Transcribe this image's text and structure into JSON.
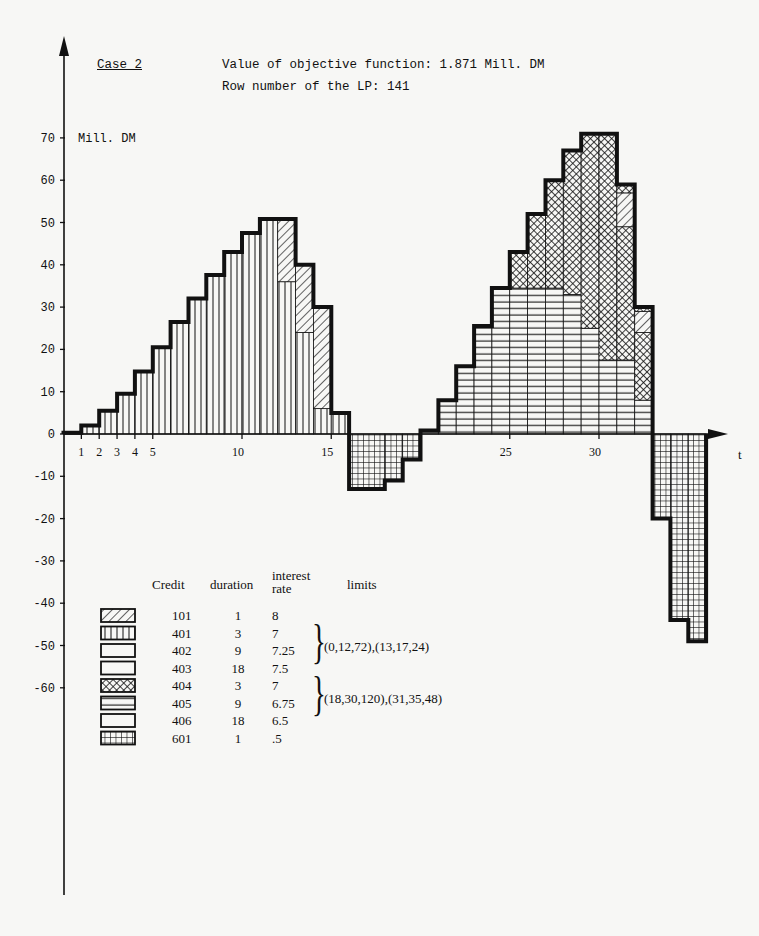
{
  "header": {
    "case_label": "Case 2",
    "objective_text": "Value of objective function: 1.871 Mill. DM",
    "row_number_text": "Row number of the LP:  141"
  },
  "legend": {
    "headers": {
      "credit": "Credit",
      "duration": "duration",
      "interest_line1": "interest",
      "interest_line2": "rate",
      "limits": "limits"
    },
    "rows": [
      {
        "pattern": "diag",
        "credit": "101",
        "duration": "1",
        "rate": "8"
      },
      {
        "pattern": "vert",
        "credit": "401",
        "duration": "3",
        "rate": "7"
      },
      {
        "pattern": "blank",
        "credit": "402",
        "duration": "9",
        "rate": "7.25"
      },
      {
        "pattern": "blank",
        "credit": "403",
        "duration": "18",
        "rate": "7.5"
      },
      {
        "pattern": "cross",
        "credit": "404",
        "duration": "3",
        "rate": "7"
      },
      {
        "pattern": "horiz",
        "credit": "405",
        "duration": "9",
        "rate": "6.75"
      },
      {
        "pattern": "blank",
        "credit": "406",
        "duration": "18",
        "rate": "6.5"
      },
      {
        "pattern": "grid",
        "credit": "601",
        "duration": "1",
        "rate": ".5"
      }
    ],
    "limits_group1": "(0,12,72),(13,17,24)",
    "limits_group2": "(18,30,120),(31,35,48)"
  },
  "chart_data": {
    "type": "bar",
    "xlabel": "t",
    "ylabel": "Mill. DM",
    "ylim": [
      -60,
      70
    ],
    "xlim": [
      0,
      37
    ],
    "yticks": [
      70,
      60,
      50,
      40,
      30,
      20,
      10,
      0,
      -10,
      -20,
      -30,
      -40,
      -50,
      -60
    ],
    "xtick_labels": [
      1,
      2,
      3,
      4,
      5,
      10,
      15,
      25,
      30
    ],
    "grid": false,
    "legend_position": "bottom-left",
    "segments": [
      {
        "t": [
          0,
          1
        ],
        "credit": "401",
        "from": 0,
        "to": 0.3
      },
      {
        "t": [
          1,
          2
        ],
        "credit": "401",
        "from": 0,
        "to": 2
      },
      {
        "t": [
          2,
          3
        ],
        "credit": "401",
        "from": 0,
        "to": 5.5
      },
      {
        "t": [
          3,
          4
        ],
        "credit": "401",
        "from": 0,
        "to": 9.5
      },
      {
        "t": [
          4,
          5
        ],
        "credit": "401",
        "from": 0,
        "to": 14.8
      },
      {
        "t": [
          5,
          6
        ],
        "credit": "401",
        "from": 0,
        "to": 20.5
      },
      {
        "t": [
          6,
          7
        ],
        "credit": "401",
        "from": 0,
        "to": 26.5
      },
      {
        "t": [
          7,
          8
        ],
        "credit": "401",
        "from": 0,
        "to": 32
      },
      {
        "t": [
          8,
          9
        ],
        "credit": "401",
        "from": 0,
        "to": 37.6
      },
      {
        "t": [
          9,
          10
        ],
        "credit": "401",
        "from": 0,
        "to": 43
      },
      {
        "t": [
          10,
          11
        ],
        "credit": "401",
        "from": 0,
        "to": 47.5
      },
      {
        "t": [
          11,
          12
        ],
        "credit": "401",
        "from": 0,
        "to": 50.8
      },
      {
        "t": [
          12,
          13
        ],
        "credit": "401",
        "from": 0,
        "to": 36
      },
      {
        "t": [
          12,
          13
        ],
        "credit": "101",
        "from": 36,
        "to": 50.8
      },
      {
        "t": [
          13,
          14
        ],
        "credit": "401",
        "from": 0,
        "to": 24
      },
      {
        "t": [
          13,
          14
        ],
        "credit": "101",
        "from": 24,
        "to": 40
      },
      {
        "t": [
          14,
          15
        ],
        "credit": "401",
        "from": 0,
        "to": 6
      },
      {
        "t": [
          14,
          15
        ],
        "credit": "101",
        "from": 6,
        "to": 30
      },
      {
        "t": [
          15,
          16
        ],
        "credit": "401",
        "from": 0,
        "to": 5
      },
      {
        "t": [
          16,
          18
        ],
        "credit": "601",
        "from": -13,
        "to": 0
      },
      {
        "t": [
          18,
          19
        ],
        "credit": "601",
        "from": -11,
        "to": 0
      },
      {
        "t": [
          19,
          20
        ],
        "credit": "601",
        "from": -6,
        "to": 0
      },
      {
        "t": [
          20,
          21
        ],
        "credit": "405",
        "from": 0,
        "to": 0.8
      },
      {
        "t": [
          21,
          22
        ],
        "credit": "405",
        "from": 0,
        "to": 8
      },
      {
        "t": [
          22,
          23
        ],
        "credit": "405",
        "from": 0,
        "to": 16
      },
      {
        "t": [
          23,
          24
        ],
        "credit": "405",
        "from": 0,
        "to": 25.5
      },
      {
        "t": [
          24,
          25
        ],
        "credit": "405",
        "from": 0,
        "to": 34.5
      },
      {
        "t": [
          25,
          26
        ],
        "credit": "405",
        "from": 0,
        "to": 34.5
      },
      {
        "t": [
          25,
          26
        ],
        "credit": "404",
        "from": 34.5,
        "to": 43
      },
      {
        "t": [
          26,
          27
        ],
        "credit": "405",
        "from": 0,
        "to": 34.5
      },
      {
        "t": [
          26,
          27
        ],
        "credit": "404",
        "from": 34.5,
        "to": 52
      },
      {
        "t": [
          27,
          28
        ],
        "credit": "405",
        "from": 0,
        "to": 34.5
      },
      {
        "t": [
          27,
          28
        ],
        "credit": "404",
        "from": 34.5,
        "to": 60
      },
      {
        "t": [
          28,
          29
        ],
        "credit": "405",
        "from": 0,
        "to": 33
      },
      {
        "t": [
          28,
          29
        ],
        "credit": "404",
        "from": 33,
        "to": 67
      },
      {
        "t": [
          29,
          30
        ],
        "credit": "405",
        "from": 0,
        "to": 25
      },
      {
        "t": [
          29,
          30
        ],
        "credit": "404",
        "from": 25,
        "to": 71
      },
      {
        "t": [
          30,
          31
        ],
        "credit": "405",
        "from": 0,
        "to": 17.5
      },
      {
        "t": [
          30,
          31
        ],
        "credit": "404",
        "from": 17.5,
        "to": 71
      },
      {
        "t": [
          31,
          32
        ],
        "credit": "405",
        "from": 0,
        "to": 17.5
      },
      {
        "t": [
          31,
          32
        ],
        "credit": "404",
        "from": 17.5,
        "to": 49
      },
      {
        "t": [
          31,
          32
        ],
        "credit": "101",
        "from": 49,
        "to": 57
      },
      {
        "t": [
          31,
          32
        ],
        "credit": "404",
        "from": 57,
        "to": 59
      },
      {
        "t": [
          32,
          33
        ],
        "credit": "405",
        "from": 0,
        "to": 8
      },
      {
        "t": [
          32,
          33
        ],
        "credit": "404",
        "from": 8,
        "to": 24
      },
      {
        "t": [
          32,
          33
        ],
        "credit": "101",
        "from": 24,
        "to": 29
      },
      {
        "t": [
          32,
          33
        ],
        "credit": "404",
        "from": 29,
        "to": 30
      },
      {
        "t": [
          33,
          34
        ],
        "credit": "601",
        "from": -20,
        "to": 0
      },
      {
        "t": [
          34,
          35
        ],
        "credit": "601",
        "from": -44,
        "to": 0
      },
      {
        "t": [
          35,
          36
        ],
        "credit": "601",
        "from": -49,
        "to": 0
      }
    ],
    "outline": [
      [
        0,
        0
      ],
      [
        0,
        0.3
      ],
      [
        1,
        0.3
      ],
      [
        1,
        2
      ],
      [
        2,
        2
      ],
      [
        2,
        5.5
      ],
      [
        3,
        5.5
      ],
      [
        3,
        9.5
      ],
      [
        4,
        9.5
      ],
      [
        4,
        14.8
      ],
      [
        5,
        14.8
      ],
      [
        5,
        20.5
      ],
      [
        6,
        20.5
      ],
      [
        6,
        26.5
      ],
      [
        7,
        26.5
      ],
      [
        7,
        32
      ],
      [
        8,
        32
      ],
      [
        8,
        37.6
      ],
      [
        9,
        37.6
      ],
      [
        9,
        43
      ],
      [
        10,
        43
      ],
      [
        10,
        47.5
      ],
      [
        11,
        47.5
      ],
      [
        11,
        50.8
      ],
      [
        13,
        50.8
      ],
      [
        13,
        40
      ],
      [
        14,
        40
      ],
      [
        14,
        30
      ],
      [
        15,
        30
      ],
      [
        15,
        5
      ],
      [
        16,
        5
      ],
      [
        16,
        -13
      ],
      [
        18,
        -13
      ],
      [
        18,
        -11
      ],
      [
        19,
        -11
      ],
      [
        19,
        -6
      ],
      [
        20,
        -6
      ],
      [
        20,
        0.8
      ],
      [
        21,
        0.8
      ],
      [
        21,
        8
      ],
      [
        22,
        8
      ],
      [
        22,
        16
      ],
      [
        23,
        16
      ],
      [
        23,
        25.5
      ],
      [
        24,
        25.5
      ],
      [
        24,
        34.5
      ],
      [
        25,
        34.5
      ],
      [
        25,
        43
      ],
      [
        26,
        43
      ],
      [
        26,
        52
      ],
      [
        27,
        52
      ],
      [
        27,
        60
      ],
      [
        28,
        60
      ],
      [
        28,
        67
      ],
      [
        29,
        67
      ],
      [
        29,
        71
      ],
      [
        31,
        71
      ],
      [
        31,
        59
      ],
      [
        32,
        59
      ],
      [
        32,
        30
      ],
      [
        33,
        30
      ],
      [
        33,
        -20
      ],
      [
        34,
        -20
      ],
      [
        34,
        -44
      ],
      [
        35,
        -44
      ],
      [
        35,
        -49
      ],
      [
        36,
        -49
      ],
      [
        36,
        0
      ]
    ]
  },
  "colors": {
    "ink": "#111111",
    "paper": "#f7f7f5"
  }
}
